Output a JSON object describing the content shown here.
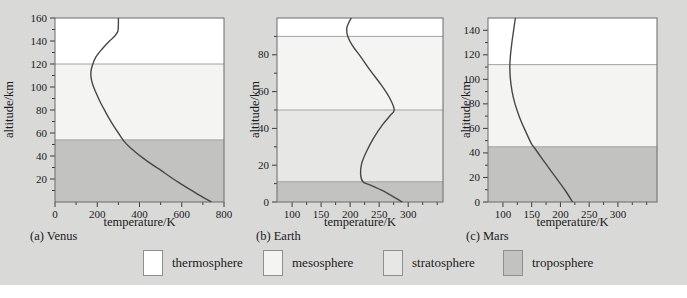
{
  "page": {
    "background": "#d9d9d8",
    "plot_border_color": "#6b6b6b",
    "boundary_line_color": "#9a9a9a",
    "curve_color": "#4a4743",
    "tick_color": "#3a3a3a"
  },
  "layers": {
    "thermosphere": {
      "label": "thermosphere",
      "color": "#ffffff"
    },
    "mesosphere": {
      "label": "mesosphere",
      "color": "#f4f4f3"
    },
    "stratosphere": {
      "label": "stratosphere",
      "color": "#e7e7e6"
    },
    "troposphere": {
      "label": "troposphere",
      "color": "#c2c2c1"
    }
  },
  "legend": {
    "items": [
      {
        "key": "thermosphere",
        "label": "thermosphere"
      },
      {
        "key": "mesosphere",
        "label": "mesosphere"
      },
      {
        "key": "stratosphere",
        "label": "stratosphere"
      },
      {
        "key": "troposphere",
        "label": "troposphere"
      }
    ]
  },
  "chart_data": [
    {
      "type": "line",
      "planet": "Venus",
      "caption": "(a) Venus",
      "xlabel": "temperature/K",
      "ylabel": "altitude/km",
      "xlim": [
        0,
        800
      ],
      "ylim": [
        0,
        160
      ],
      "xticks": [
        0,
        200,
        400,
        600,
        800
      ],
      "xminor": [
        100,
        300,
        500,
        700
      ],
      "yticks": [
        20,
        40,
        60,
        80,
        100,
        120,
        140,
        160
      ],
      "yminor": [
        10,
        30,
        50,
        70,
        90,
        110,
        130,
        150
      ],
      "bands": [
        {
          "layer": "troposphere",
          "from": 0,
          "to": 54
        },
        {
          "layer": "mesosphere",
          "from": 54,
          "to": 120
        },
        {
          "layer": "thermosphere",
          "from": 120,
          "to": 160
        }
      ],
      "curve": [
        [
          740,
          0
        ],
        [
          665,
          8
        ],
        [
          585,
          17
        ],
        [
          505,
          27
        ],
        [
          425,
          37
        ],
        [
          358,
          47
        ],
        [
          326,
          53
        ],
        [
          300,
          60
        ],
        [
          268,
          69
        ],
        [
          240,
          78
        ],
        [
          214,
          87
        ],
        [
          194,
          95
        ],
        [
          179,
          102
        ],
        [
          171,
          108
        ],
        [
          170,
          113
        ],
        [
          177,
          119
        ],
        [
          193,
          126
        ],
        [
          223,
          133
        ],
        [
          258,
          140
        ],
        [
          286,
          145
        ],
        [
          298,
          149
        ],
        [
          300,
          155
        ],
        [
          300,
          160
        ]
      ]
    },
    {
      "type": "line",
      "planet": "Earth",
      "caption": "(b) Earth",
      "xlabel": "temperature/K",
      "ylabel": "altitude/km",
      "xlim": [
        74,
        360
      ],
      "ylim": [
        0,
        100
      ],
      "xticks": [
        100,
        150,
        200,
        250,
        300
      ],
      "xminor": [
        125,
        175,
        225,
        275,
        325,
        350
      ],
      "yticks": [
        0,
        20,
        40,
        60,
        80
      ],
      "yminor": [
        10,
        30,
        50,
        70,
        90
      ],
      "bands": [
        {
          "layer": "troposphere",
          "from": 0,
          "to": 11
        },
        {
          "layer": "stratosphere",
          "from": 11,
          "to": 50
        },
        {
          "layer": "mesosphere",
          "from": 50,
          "to": 90
        },
        {
          "layer": "thermosphere",
          "from": 90,
          "to": 100
        }
      ],
      "curve": [
        [
          290,
          0
        ],
        [
          263,
          5
        ],
        [
          236,
          9
        ],
        [
          222,
          11
        ],
        [
          218,
          15
        ],
        [
          220,
          21
        ],
        [
          229,
          28
        ],
        [
          241,
          35
        ],
        [
          256,
          42
        ],
        [
          269,
          47
        ],
        [
          276,
          50
        ],
        [
          269,
          56
        ],
        [
          255,
          63
        ],
        [
          236,
          71
        ],
        [
          218,
          79
        ],
        [
          204,
          85
        ],
        [
          196,
          90
        ],
        [
          194,
          94
        ],
        [
          197,
          97
        ],
        [
          202,
          100
        ]
      ]
    },
    {
      "type": "line",
      "planet": "Mars",
      "caption": "(c) Mars",
      "xlabel": "temperature/K",
      "ylabel": "altitude/km",
      "xlim": [
        74,
        368
      ],
      "ylim": [
        0,
        150
      ],
      "xticks": [
        100,
        150,
        200,
        250,
        300
      ],
      "xminor": [
        125,
        175,
        225,
        275,
        325,
        350
      ],
      "yticks": [
        0,
        20,
        40,
        60,
        80,
        100,
        120,
        140
      ],
      "yminor": [
        10,
        30,
        50,
        70,
        90,
        110,
        130
      ],
      "bands": [
        {
          "layer": "troposphere",
          "from": 0,
          "to": 45
        },
        {
          "layer": "mesosphere",
          "from": 45,
          "to": 112
        },
        {
          "layer": "thermosphere",
          "from": 112,
          "to": 150
        }
      ],
      "curve": [
        [
          221,
          0
        ],
        [
          209,
          9
        ],
        [
          195,
          18
        ],
        [
          181,
          27
        ],
        [
          167,
          36
        ],
        [
          155,
          44
        ],
        [
          149,
          48
        ],
        [
          139,
          58
        ],
        [
          129,
          69
        ],
        [
          121,
          80
        ],
        [
          116,
          90
        ],
        [
          113,
          100
        ],
        [
          112,
          110
        ],
        [
          113,
          119
        ],
        [
          115,
          128
        ],
        [
          118,
          138
        ],
        [
          121,
          148
        ],
        [
          122,
          150
        ]
      ]
    }
  ]
}
